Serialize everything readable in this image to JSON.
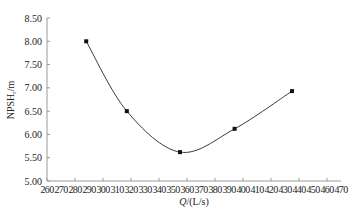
{
  "chart_data": {
    "type": "line",
    "title": "",
    "xlabel": "Q/(L/s)",
    "ylabel": "NPSHr/m",
    "xlim": [
      260,
      470
    ],
    "ylim": [
      5.0,
      8.5
    ],
    "x_ticks": [
      260,
      270,
      280,
      290,
      300,
      310,
      320,
      330,
      340,
      350,
      360,
      370,
      380,
      390,
      400,
      410,
      420,
      430,
      440,
      450,
      460,
      470
    ],
    "y_ticks": [
      "5.00",
      "5.50",
      "6.00",
      "6.50",
      "7.00",
      "7.50",
      "8.00",
      "8.50"
    ],
    "grid": false,
    "legend": null,
    "smooth": true,
    "series": [
      {
        "name": "NPSHr",
        "x": [
          288,
          317,
          355,
          394,
          435
        ],
        "y": [
          8.0,
          6.5,
          5.62,
          6.12,
          6.93
        ]
      }
    ]
  },
  "labels": {
    "xlabel_main": "Q",
    "xlabel_unit": "/(L/s)",
    "ylabel_main": "NPSH",
    "ylabel_sub": "r",
    "ylabel_unit": "/m"
  },
  "colors": {
    "axis": "#9a9a9a",
    "line": "#3a3a3a",
    "marker": "#111111",
    "text": "#222222"
  }
}
